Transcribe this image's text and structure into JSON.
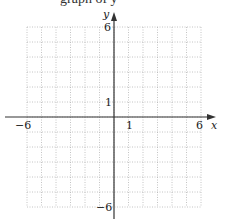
{
  "header": {
    "cropped_text": "graph of y"
  },
  "chart_data": {
    "type": "line",
    "title": "",
    "xlabel": "x",
    "ylabel": "y",
    "xlim": [
      -6,
      6
    ],
    "ylim": [
      -6,
      6
    ],
    "grid": true,
    "grid_step": 1,
    "series": [],
    "x_tick_labels": [
      {
        "value": -6,
        "label": "−6"
      },
      {
        "value": 1,
        "label": "1"
      },
      {
        "value": 6,
        "label": "6"
      }
    ],
    "y_tick_labels": [
      {
        "value": 6,
        "label": "6"
      },
      {
        "value": 1,
        "label": "1"
      },
      {
        "value": -6,
        "label": "−6"
      }
    ]
  },
  "labels": {
    "x_axis": "x",
    "y_axis": "y",
    "x_neg6": "−6",
    "x_1": "1",
    "x_6": "6",
    "y_6": "6",
    "y_1": "1",
    "y_neg6": "−6"
  },
  "colors": {
    "grid": "#b5b5b5",
    "axis": "#333333"
  }
}
